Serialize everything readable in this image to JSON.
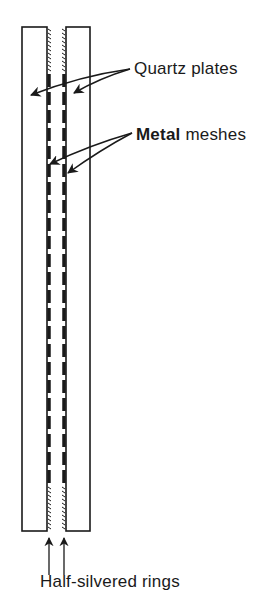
{
  "diagram": {
    "type": "cross-section schematic",
    "components": [
      "quartz plates",
      "metal meshes",
      "half-silvered rings"
    ],
    "labels": {
      "quartz": "Quartz plates",
      "metal_word": "Metal",
      "meshes_word": " meshes",
      "rings": "Half-silvered rings"
    },
    "colors": {
      "ink": "#1a1a1a",
      "background": "#ffffff"
    }
  }
}
